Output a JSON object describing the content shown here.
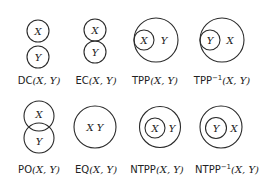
{
  "relations": [
    {
      "id": "DC",
      "name": "DC",
      "sup": "",
      "args": "(X, Y)",
      "inner_a": "X",
      "inner_b": "Y"
    },
    {
      "id": "EC",
      "name": "EC",
      "sup": "",
      "args": "(X, Y)",
      "inner_a": "X",
      "inner_b": "Y"
    },
    {
      "id": "TPP",
      "name": "TPP",
      "sup": "",
      "args": "(X, Y)",
      "inner_a": "X",
      "inner_b": "Y"
    },
    {
      "id": "TPPi",
      "name": "TPP",
      "sup": "−1",
      "args": "(X, Y)",
      "inner_a": "Y",
      "inner_b": "X"
    },
    {
      "id": "PO",
      "name": "PO",
      "sup": "",
      "args": "(X, Y)",
      "inner_a": "X",
      "inner_b": "Y"
    },
    {
      "id": "EQ",
      "name": "EQ",
      "sup": "",
      "args": "(X, Y)",
      "inner_a": "X Y",
      "inner_b": ""
    },
    {
      "id": "NTPP",
      "name": "NTPP",
      "sup": "",
      "args": "(X, Y)",
      "inner_a": "X",
      "inner_b": "Y"
    },
    {
      "id": "NTPPi",
      "name": "NTPP",
      "sup": "−1",
      "args": "(X, Y)",
      "inner_a": "Y",
      "inner_b": "X"
    }
  ],
  "colors": {
    "stroke": "#2a2a2a",
    "text": "#222222",
    "background": "#ffffff"
  }
}
